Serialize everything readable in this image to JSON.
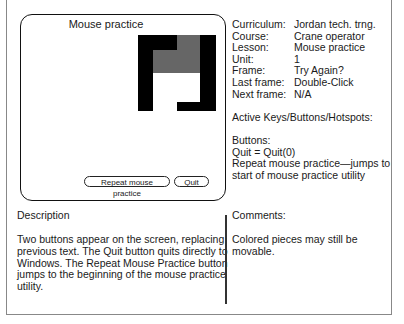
{
  "screen": {
    "title": "Mouse practice",
    "buttons": {
      "repeat": "Repeat mouse practice",
      "quit": "Quit"
    },
    "colors": {
      "block": "#000000",
      "piece": "#666666"
    }
  },
  "info": {
    "rows": [
      {
        "label": "Curriculum:",
        "value": "Jordan tech. trng."
      },
      {
        "label": "Course:",
        "value": "Crane operator"
      },
      {
        "label": "Lesson:",
        "value": "Mouse practice"
      },
      {
        "label": "Unit:",
        "value": "1"
      },
      {
        "label": "Frame:",
        "value": "Try Again?"
      },
      {
        "label": "Last frame:",
        "value": "Double-Click"
      },
      {
        "label": "Next frame:",
        "value": "N/A"
      }
    ],
    "active_heading": "Active Keys/Buttons/Hotspots:",
    "buttons_heading": "Buttons:",
    "buttons_line1": "Quit = Quit(0)",
    "buttons_line2": "Repeat mouse practice—jumps to",
    "buttons_line3": "start of mouse practice utility"
  },
  "description": {
    "heading": "Description",
    "lines": [
      "Two buttons appear on the screen, replacing",
      "previous text. The Quit button quits directly to",
      "Windows. The Repeat Mouse Practice button",
      "jumps to the beginning of the mouse practice",
      "utility."
    ]
  },
  "comments": {
    "heading": "Comments:",
    "lines": [
      "Colored pieces may still be",
      "movable."
    ]
  }
}
